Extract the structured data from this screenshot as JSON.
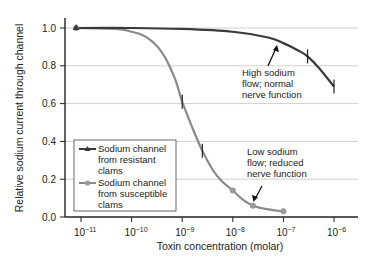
{
  "chart_data": {
    "type": "line",
    "title": "",
    "xlabel": "Toxin concentration (molar)",
    "ylabel": "Relative sodium current through channel",
    "xscale": "log",
    "xlim": [
      5e-12,
      2e-06
    ],
    "ylim": [
      0.0,
      1.0
    ],
    "x_ticks": [
      "10⁻¹¹",
      "10⁻¹⁰",
      "10⁻⁹",
      "10⁻⁸",
      "10⁻⁷",
      "10⁻⁶"
    ],
    "y_ticks": [
      "0.0",
      "0.2",
      "0.4",
      "0.6",
      "0.8",
      "1.0"
    ],
    "grid": "horizontal",
    "legend_position": "lower left",
    "series": [
      {
        "name": "Sodium channel from resistant clams",
        "marker": "triangle",
        "color": "#3a3a3a",
        "x": [
          8e-12,
          3e-07,
          1e-06
        ],
        "y": [
          1.0,
          0.85,
          0.69
        ],
        "curve": [
          [
            8e-12,
            1.0
          ],
          [
            1e-10,
            1.0
          ],
          [
            1e-09,
            0.995
          ],
          [
            1e-08,
            0.98
          ],
          [
            5e-08,
            0.95
          ],
          [
            1e-07,
            0.92
          ],
          [
            2e-07,
            0.88
          ],
          [
            3e-07,
            0.85
          ],
          [
            5e-07,
            0.79
          ],
          [
            1e-06,
            0.69
          ]
        ]
      },
      {
        "name": "Sodium channel from susceptible clams",
        "marker": "circle",
        "color": "#8a8a8a",
        "x": [
          8e-12,
          1e-09,
          2.5e-09,
          1e-08,
          2.5e-08,
          1e-07
        ],
        "y": [
          1.0,
          0.61,
          0.35,
          0.14,
          0.06,
          0.03
        ],
        "curve": [
          [
            8e-12,
            1.0
          ],
          [
            5e-11,
            0.995
          ],
          [
            1e-10,
            0.98
          ],
          [
            2e-10,
            0.95
          ],
          [
            4e-10,
            0.87
          ],
          [
            7e-10,
            0.74
          ],
          [
            1e-09,
            0.61
          ],
          [
            1.6e-09,
            0.47
          ],
          [
            2.5e-09,
            0.35
          ],
          [
            4e-09,
            0.25
          ],
          [
            6e-09,
            0.19
          ],
          [
            1e-08,
            0.14
          ],
          [
            1.6e-08,
            0.09
          ],
          [
            2.5e-08,
            0.06
          ],
          [
            5e-08,
            0.04
          ],
          [
            1e-07,
            0.03
          ]
        ]
      }
    ],
    "annotations": [
      {
        "text": [
          "High sodium",
          "flow; normal",
          "nerve function"
        ],
        "points_to": "resistant curve near 1e-7"
      },
      {
        "text": [
          "Low sodium",
          "flow; reduced",
          "nerve function"
        ],
        "points_to": "susceptible curve near 2.5e-8"
      }
    ]
  },
  "legend": {
    "items": [
      {
        "lines": [
          "Sodium channel",
          "from resistant",
          "clams"
        ]
      },
      {
        "lines": [
          "Sodium channel",
          "from susceptible",
          "clams"
        ]
      }
    ]
  },
  "annotations": {
    "high": [
      "High sodium",
      "flow; normal",
      "nerve function"
    ],
    "low": [
      "Low sodium",
      "flow; reduced",
      "nerve function"
    ]
  },
  "axes": {
    "xlabel": "Toxin concentration (molar)",
    "ylabel": "Relative sodium current through channel",
    "y_ticks": [
      "0.0",
      "0.2",
      "0.4",
      "0.6",
      "0.8",
      "1.0"
    ],
    "x_ticks_base": "10",
    "x_ticks_exp": [
      "−11",
      "−10",
      "−9",
      "−8",
      "−7",
      "−6"
    ]
  }
}
